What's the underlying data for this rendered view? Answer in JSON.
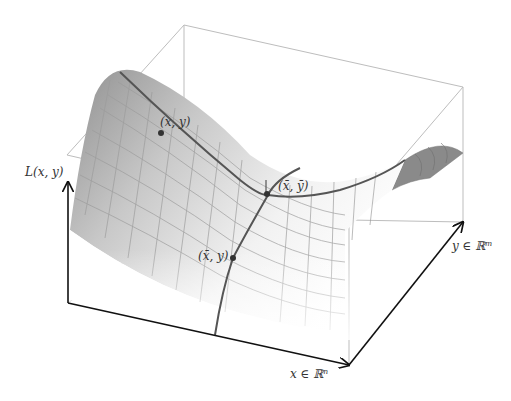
{
  "figure": {
    "axes": {
      "vertical": {
        "label": "L(x, y)"
      },
      "x_axis": {
        "label": "x ∈ ℝⁿ"
      },
      "y_axis": {
        "label": "y ∈ ℝᵐ"
      }
    },
    "points": [
      {
        "id": "p1",
        "label": "(x, y)"
      },
      {
        "id": "p2",
        "label": "(x̄, ȳ)"
      },
      {
        "id": "p3",
        "label": "(x̄, y)"
      }
    ],
    "colors": {
      "axis": "#111111",
      "box": "#bbbbbb",
      "curve": "#555555",
      "surface_dark": "#8c8c8c",
      "surface_light": "#f4f4f4",
      "grid": "#9a9a9a"
    }
  }
}
